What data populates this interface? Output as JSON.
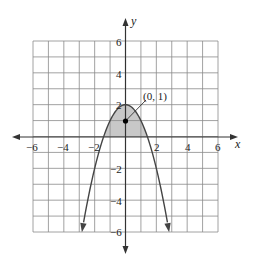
{
  "chart_data": {
    "type": "line",
    "title": "",
    "equation": "y = 2 - x^2",
    "xlabel": "x",
    "ylabel": "y",
    "xlim": [
      -6,
      6
    ],
    "ylim": [
      -6,
      6
    ],
    "grid": true,
    "grid_step": 1,
    "x_ticks": [
      -6,
      -4,
      -2,
      2,
      4,
      6
    ],
    "y_ticks": [
      6,
      4,
      2,
      -2,
      -4,
      -6
    ],
    "x_tick_labels": [
      "−6",
      "−4",
      "−2",
      "2",
      "4",
      "6"
    ],
    "y_tick_labels": [
      "6",
      "4",
      "2",
      "−2",
      "−4",
      "−6"
    ],
    "series": [
      {
        "name": "parabola",
        "x": [
          -2.83,
          -2,
          -1.41,
          -1,
          0,
          1,
          1.41,
          2,
          2.83
        ],
        "y": [
          -6,
          -2,
          0,
          1,
          2,
          1,
          0,
          -2,
          -6
        ],
        "arrows_at_ends": true
      }
    ],
    "shaded_region": {
      "description": "region between the parabola and the x-axis",
      "x_range": [
        -1.41,
        1.41
      ],
      "color": "#c8c8c8"
    },
    "annotations": [
      {
        "text": "(0, 1)",
        "point": [
          0,
          1
        ],
        "marker": "filled-dot"
      }
    ]
  },
  "labels": {
    "x_axis": "x",
    "y_axis": "y",
    "point": "(0, 1)",
    "x_ticks": [
      "−6",
      "−4",
      "−2",
      "2",
      "4",
      "6"
    ],
    "y_ticks": [
      "6",
      "4",
      "2",
      "−2",
      "−4",
      "−6"
    ]
  },
  "colors": {
    "grid": "#8a8a8a",
    "axis": "#333333",
    "curve": "#444444",
    "shade": "#c8c8c8",
    "point": "#000000"
  }
}
